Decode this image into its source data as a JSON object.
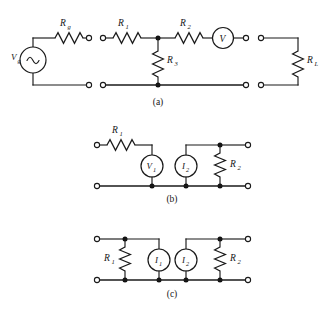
{
  "figure": {
    "type": "electrical-circuit-diagram",
    "background_color": "#ffffff",
    "line_color": "#1a1a1a",
    "panel_count": 3
  },
  "panels": [
    {
      "id": "panel-a",
      "caption": "(a)",
      "description": "Source with series resistance connected to a resistive T-network, a voltmeter, and a load resistor, shown as four separable two-terminal blocks.",
      "blocks": [
        {
          "id": "source-block",
          "components": [
            {
              "name": "source",
              "label": "V",
              "sub": "g",
              "kind": "ac-voltage-source",
              "symbol": "~"
            },
            {
              "name": "series-resistor",
              "label": "R",
              "sub": "g",
              "kind": "resistor"
            }
          ]
        },
        {
          "id": "t-network-block",
          "components": [
            {
              "name": "series-resistor-1",
              "label": "R",
              "sub": "1",
              "kind": "resistor"
            },
            {
              "name": "series-resistor-2",
              "label": "R",
              "sub": "2",
              "kind": "resistor"
            },
            {
              "name": "shunt-resistor-3",
              "label": "R",
              "sub": "3",
              "kind": "resistor"
            }
          ]
        },
        {
          "id": "meter-block",
          "components": [
            {
              "name": "voltmeter",
              "label": "V",
              "sub": "",
              "kind": "voltmeter"
            }
          ]
        },
        {
          "id": "load-block",
          "components": [
            {
              "name": "load-resistor",
              "label": "R",
              "sub": "L",
              "kind": "resistor"
            }
          ]
        }
      ]
    },
    {
      "id": "panel-b",
      "caption": "(b)",
      "description": "Two-port with series resistor R1 feeding voltage source V1, and current source I2 in parallel with R2.",
      "components": [
        {
          "name": "series-resistor-1",
          "label": "R",
          "sub": "1",
          "kind": "resistor"
        },
        {
          "name": "voltage-source-1",
          "label": "V",
          "sub": "1",
          "kind": "voltage-source"
        },
        {
          "name": "current-source-2",
          "label": "I",
          "sub": "2",
          "kind": "current-source"
        },
        {
          "name": "shunt-resistor-2",
          "label": "R",
          "sub": "2",
          "kind": "resistor"
        }
      ]
    },
    {
      "id": "panel-c",
      "caption": "(c)",
      "description": "Symmetric Norton pair: R1 in parallel with current source I1 on the left, current source I2 in parallel with R2 on the right.",
      "components": [
        {
          "name": "shunt-resistor-1",
          "label": "R",
          "sub": "1",
          "kind": "resistor"
        },
        {
          "name": "current-source-1",
          "label": "I",
          "sub": "1",
          "kind": "current-source"
        },
        {
          "name": "current-source-2",
          "label": "I",
          "sub": "2",
          "kind": "current-source"
        },
        {
          "name": "shunt-resistor-2",
          "label": "R",
          "sub": "2",
          "kind": "resistor"
        }
      ]
    }
  ],
  "labels": {
    "a": {
      "rg_main": "R",
      "rg_sub": "g",
      "vg_main": "V",
      "vg_sub": "g",
      "ac_symbol": "~",
      "r1_main": "R",
      "r1_sub": "1",
      "r2_main": "R",
      "r2_sub": "2",
      "r3_main": "R",
      "r3_sub": "3",
      "vm_main": "V",
      "rl_main": "R",
      "rl_sub": "L",
      "caption": "(a)"
    },
    "b": {
      "r1_main": "R",
      "r1_sub": "1",
      "v1_main": "V",
      "v1_sub": "1",
      "i2_main": "I",
      "i2_sub": "2",
      "r2_main": "R",
      "r2_sub": "2",
      "caption": "(b)"
    },
    "c": {
      "r1_main": "R",
      "r1_sub": "1",
      "i1_main": "I",
      "i1_sub": "1",
      "i2_main": "I",
      "i2_sub": "2",
      "r2_main": "R",
      "r2_sub": "2",
      "caption": "(c)"
    }
  }
}
